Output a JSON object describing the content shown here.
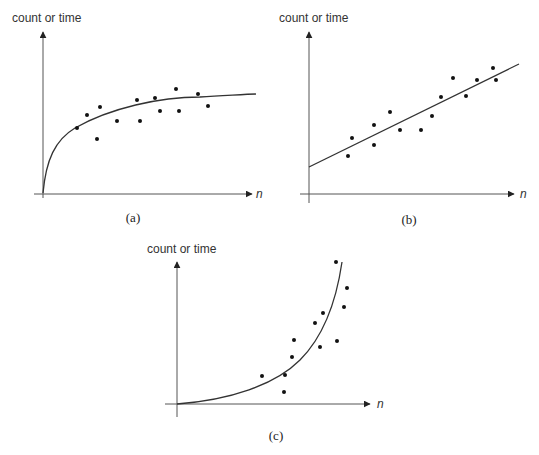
{
  "chart_data": [
    {
      "type": "scatter",
      "panel": "a",
      "caption": "(a)",
      "ylabel": "count or time",
      "xlabel": "n",
      "trend": "logarithmic / square-root growth curve",
      "points_px": [
        [
          77,
          128
        ],
        [
          87,
          115
        ],
        [
          97,
          139
        ],
        [
          100,
          107
        ],
        [
          117,
          121
        ],
        [
          137,
          100
        ],
        [
          140,
          121
        ],
        [
          155,
          98
        ],
        [
          160,
          111
        ],
        [
          176,
          89
        ],
        [
          179,
          111
        ],
        [
          198,
          94
        ],
        [
          208,
          106
        ]
      ],
      "curve_path": "M43,193 C46,160 55,140 75,128 C110,108 160,97 200,97 C225,96 245,94 256,94"
    },
    {
      "type": "scatter",
      "panel": "b",
      "caption": "(b)",
      "ylabel": "count or time",
      "xlabel": "n",
      "trend": "linear",
      "points_px": [
        [
          348,
          156
        ],
        [
          352,
          138
        ],
        [
          374,
          145
        ],
        [
          374,
          125
        ],
        [
          390,
          112
        ],
        [
          400,
          130
        ],
        [
          421,
          130
        ],
        [
          432,
          116
        ],
        [
          441,
          97
        ],
        [
          453,
          78
        ],
        [
          466,
          96
        ],
        [
          477,
          80
        ],
        [
          493,
          68
        ],
        [
          496,
          80
        ]
      ],
      "curve_path": "M309,167 L519,64"
    },
    {
      "type": "scatter",
      "panel": "c",
      "caption": "(c)",
      "ylabel": "count or time",
      "xlabel": "n",
      "trend": "exponential growth",
      "points_px": [
        [
          262,
          376
        ],
        [
          284,
          392
        ],
        [
          285,
          375
        ],
        [
          292,
          357
        ],
        [
          294,
          340
        ],
        [
          315,
          323
        ],
        [
          320,
          347
        ],
        [
          323,
          313
        ],
        [
          336,
          262
        ],
        [
          337,
          341
        ],
        [
          344,
          307
        ],
        [
          347,
          288
        ]
      ],
      "curve_path": "M177,404 C230,400 275,385 300,360 C320,340 335,310 342,262"
    }
  ],
  "labels": {
    "ylabel": "count or time",
    "xlabel": "n",
    "cap_a": "(a)",
    "cap_b": "(b)",
    "cap_c": "(c)"
  }
}
